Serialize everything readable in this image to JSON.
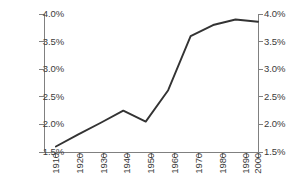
{
  "chart_data": {
    "type": "line",
    "title": "",
    "subtitle": "",
    "xlabel": "",
    "ylabel": "",
    "x": [
      1910,
      1920,
      1930,
      1940,
      1950,
      1960,
      1970,
      1980,
      1990,
      2000
    ],
    "categories": [
      "1910",
      "1920",
      "1930",
      "1940",
      "1950",
      "1960",
      "1970",
      "1980",
      "1990",
      "2000"
    ],
    "values": [
      1.6,
      1.82,
      2.03,
      2.25,
      2.05,
      2.62,
      3.6,
      3.8,
      3.9,
      3.86
    ],
    "series": [
      {
        "name": "",
        "values": [
          1.6,
          1.82,
          2.03,
          2.25,
          2.05,
          2.62,
          3.6,
          3.8,
          3.9,
          3.86
        ]
      }
    ],
    "ylim": [
      1.5,
      4.0
    ],
    "xlim": [
      1910,
      2000
    ],
    "y_ticks": [
      1.5,
      2.0,
      2.5,
      3.0,
      3.5,
      4.0
    ],
    "y_tick_labels": [
      "1.5%",
      "2.0%",
      "2.5%",
      "3.0%",
      "3.5%",
      "4.0%"
    ],
    "y_axis_right_labels": [
      "1.5%",
      "2.0%",
      "2.5%",
      "3.0%",
      "3.5%",
      "4.0%"
    ],
    "x_tick_labels": [
      "1910",
      "1920",
      "1930",
      "1940",
      "1950",
      "1960",
      "1970",
      "1980",
      "1990",
      "2000"
    ],
    "grid": false,
    "legend": false,
    "legend_position": "none",
    "dual_y_axis": true,
    "line_color": "#333333",
    "axis_color": "#808080",
    "text_color": "#3b3b3b",
    "annotations": []
  },
  "axes": {
    "left_ticks": [
      {
        "label": "4.0%",
        "value": 4.0
      },
      {
        "label": "3.5%",
        "value": 3.5
      },
      {
        "label": "3.0%",
        "value": 3.0
      },
      {
        "label": "2.5%",
        "value": 2.5
      },
      {
        "label": "2.0%",
        "value": 2.0
      },
      {
        "label": "1.5%",
        "value": 1.5
      }
    ],
    "right_ticks": [
      {
        "label": "4.0%",
        "value": 4.0
      },
      {
        "label": "3.5%",
        "value": 3.5
      },
      {
        "label": "3.0%",
        "value": 3.0
      },
      {
        "label": "2.5%",
        "value": 2.5
      },
      {
        "label": "2.0%",
        "value": 2.0
      },
      {
        "label": "1.5%",
        "value": 1.5
      }
    ],
    "bottom_ticks": [
      {
        "label": "1910"
      },
      {
        "label": "1920"
      },
      {
        "label": "1930"
      },
      {
        "label": "1940"
      },
      {
        "label": "1950"
      },
      {
        "label": "1960"
      },
      {
        "label": "1970"
      },
      {
        "label": "1980"
      },
      {
        "label": "1990"
      },
      {
        "label": "2000"
      }
    ]
  }
}
